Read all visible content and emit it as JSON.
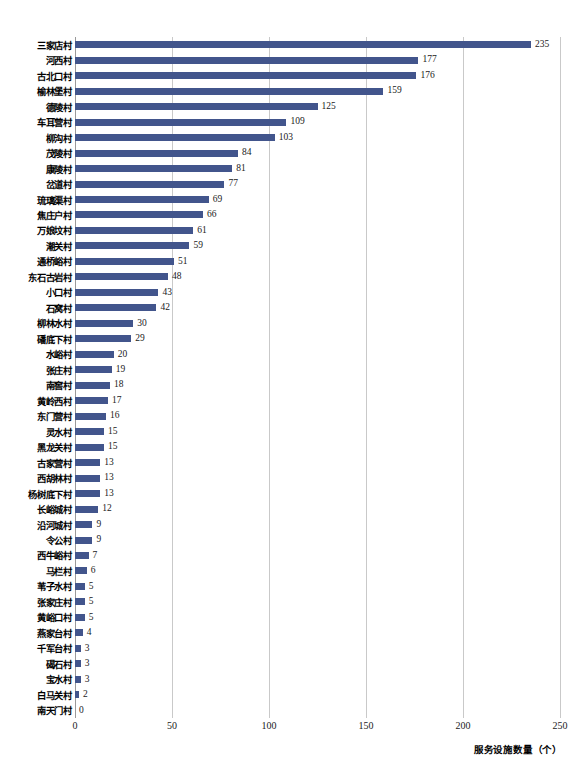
{
  "chart_data": {
    "type": "bar",
    "orientation": "horizontal",
    "title": "",
    "xlabel": "服务设施数量（个）",
    "ylabel": "",
    "xlim": [
      0,
      250
    ],
    "xticks": [
      "0",
      "50",
      "100",
      "150",
      "200",
      "250"
    ],
    "grid": true,
    "legend": "none",
    "bar_color": "#42558C",
    "gridline_color": "#c9c9c9",
    "categories": [
      "三家店村",
      "河西村",
      "古北口村",
      "榆林堡村",
      "德陵村",
      "车耳营村",
      "柳沟村",
      "茂陵村",
      "康陵村",
      "岔道村",
      "琉璃渠村",
      "焦庄户村",
      "万娘坟村",
      "潮关村",
      "通桥峪村",
      "东石古岩村",
      "小口村",
      "石窝村",
      "柳林水村",
      "磻底下村",
      "水峪村",
      "张庄村",
      "南窖村",
      "黄岭西村",
      "东门营村",
      "灵水村",
      "黑龙关村",
      "古家营村",
      "西胡林村",
      "杨树底下村",
      "长峪城村",
      "沿河城村",
      "令公村",
      "西牛峪村",
      "马栏村",
      "苇子水村",
      "张家庄村",
      "黄峪口村",
      "燕家台村",
      "千军台村",
      "碣石村",
      "宝水村",
      "白马关村",
      "南天门村"
    ],
    "values": [
      235,
      177,
      176,
      159,
      125,
      109,
      103,
      84,
      81,
      77,
      69,
      66,
      61,
      59,
      51,
      48,
      43,
      42,
      30,
      29,
      20,
      19,
      18,
      17,
      16,
      15,
      15,
      13,
      13,
      13,
      12,
      9,
      9,
      7,
      6,
      5,
      5,
      5,
      4,
      3,
      3,
      3,
      2,
      0
    ]
  }
}
